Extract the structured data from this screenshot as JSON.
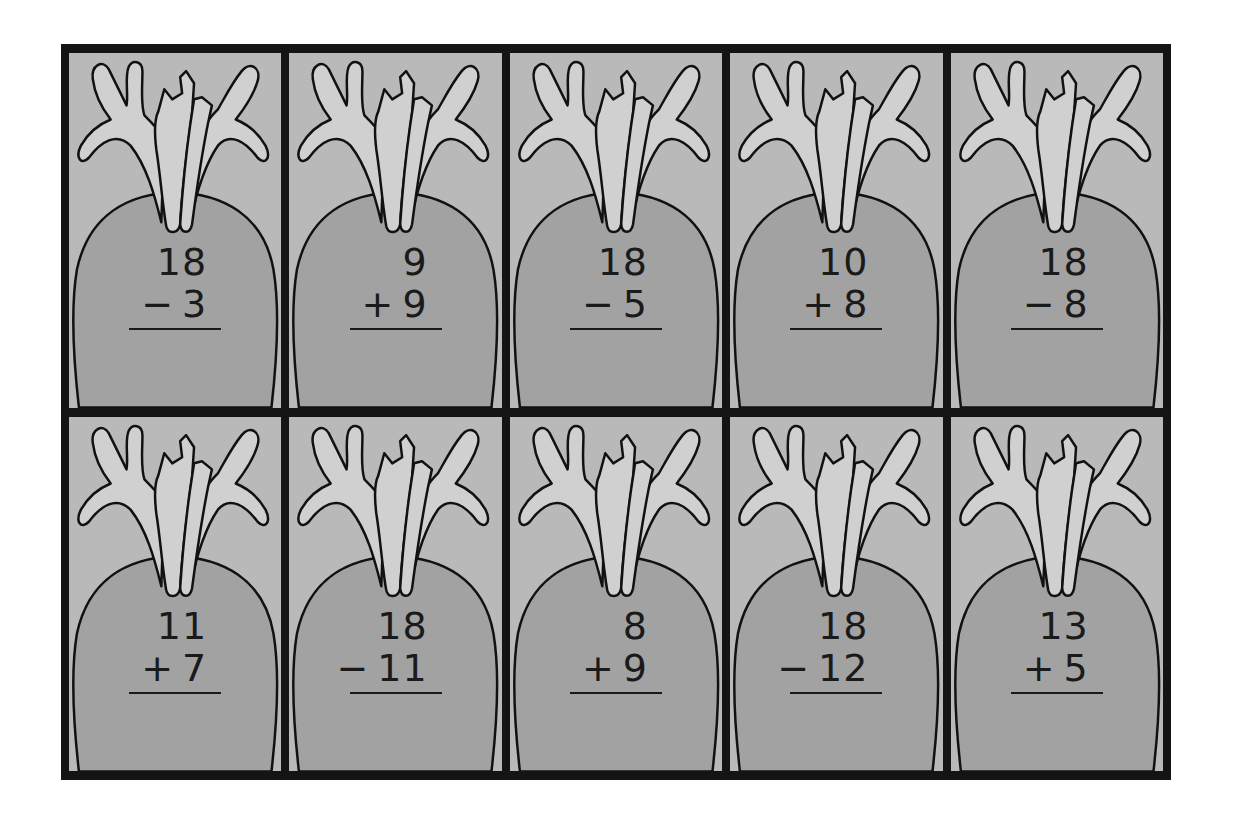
{
  "worksheet": {
    "colors": {
      "frame": "#141414",
      "card_background": "#b9b9b9",
      "carrot_body": "#a2a2a2",
      "carrot_leaves": "#d0d0d0",
      "outline": "#111111",
      "text": "#1a1a1a"
    },
    "rows": [
      {
        "cards": [
          {
            "top": "18",
            "operator": "−",
            "bottom": "3"
          },
          {
            "top": "9",
            "operator": "+",
            "bottom": "9"
          },
          {
            "top": "18",
            "operator": "−",
            "bottom": "5"
          },
          {
            "top": "10",
            "operator": "+",
            "bottom": "8"
          },
          {
            "top": "18",
            "operator": "−",
            "bottom": "8"
          }
        ]
      },
      {
        "cards": [
          {
            "top": "11",
            "operator": "+",
            "bottom": "7"
          },
          {
            "top": "18",
            "operator": "−",
            "bottom": "11"
          },
          {
            "top": "8",
            "operator": "+",
            "bottom": "9"
          },
          {
            "top": "18",
            "operator": "−",
            "bottom": "12"
          },
          {
            "top": "13",
            "operator": "+",
            "bottom": "5"
          }
        ]
      }
    ],
    "card_icon": "carrot-icon"
  }
}
